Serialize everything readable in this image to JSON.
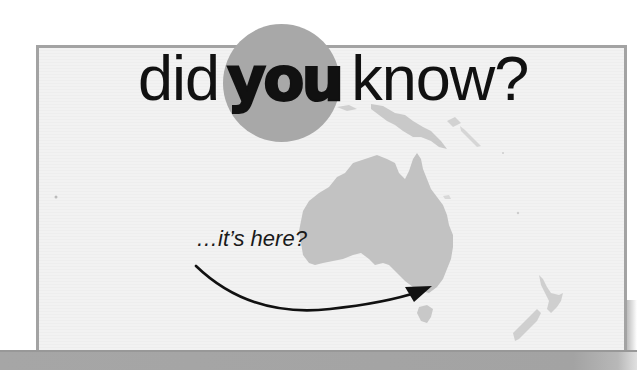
{
  "headline": {
    "word_1": "did",
    "word_2": "you",
    "word_3": "know?"
  },
  "caption": {
    "text": "…it’s here?"
  },
  "map": {
    "region": "Australia and Oceania",
    "highlighted_landmass": "Australia",
    "other_landmasses": [
      "New Guinea",
      "New Zealand",
      "Tasmania"
    ]
  },
  "colors": {
    "frame_border": "#a3a3a3",
    "frame_background": "#f1f1f1",
    "accent_circle": "#a8a8a8",
    "landmass": "#c4c4c4",
    "text": "#111111",
    "bottom_bar": "#a3a3a3"
  }
}
